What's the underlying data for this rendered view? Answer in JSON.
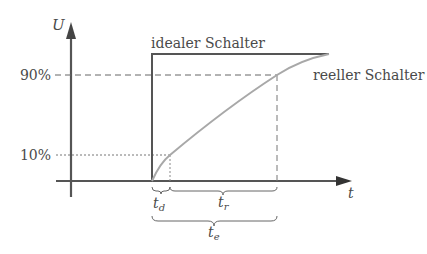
{
  "diagram": {
    "title": "",
    "axes": {
      "y_label": "U",
      "x_label": "t"
    },
    "levels": {
      "high_label": "90%",
      "low_label": "10%"
    },
    "curves": {
      "ideal_label": "idealer Schalter",
      "real_label": "reeller Schalter"
    },
    "intervals": {
      "delay": {
        "symbol": "t",
        "sub": "d"
      },
      "rise": {
        "symbol": "t",
        "sub": "r"
      },
      "on": {
        "symbol": "t",
        "sub": "e"
      }
    },
    "colors": {
      "axis": "#555555",
      "ideal": "#555555",
      "real": "#a8a8a8",
      "dashed": "#666666",
      "text": "#4a4a4a"
    }
  }
}
